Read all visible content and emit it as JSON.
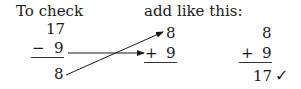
{
  "left": {
    "heading": "To check",
    "minuend": "17",
    "operator": "−",
    "subtrahend": "9",
    "difference": "8"
  },
  "middle": {
    "heading": "add like this:",
    "top": "8",
    "operator": "+",
    "bottom": "9"
  },
  "right": {
    "top": "8",
    "operator": "+",
    "bottom": "9",
    "sum": "17",
    "check_mark": "✓"
  }
}
